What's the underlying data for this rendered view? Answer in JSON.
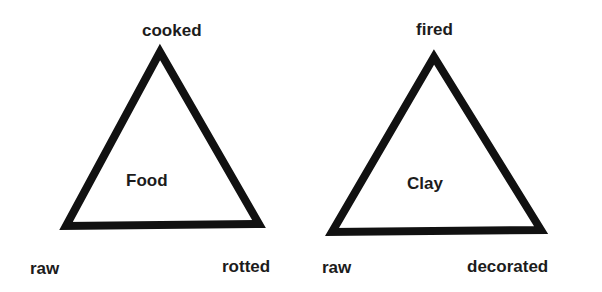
{
  "diagrams": [
    {
      "name": "Food",
      "center_label": "Food",
      "vertices": {
        "top": "cooked",
        "bottom_left": "raw",
        "bottom_right": "rotted"
      }
    },
    {
      "name": "Clay",
      "center_label": "Clay",
      "vertices": {
        "top": "fired",
        "bottom_left": "raw",
        "bottom_right": "decorated"
      }
    }
  ],
  "colors": {
    "stroke": "#111111",
    "background": "#ffffff",
    "text": "#1c1c1c"
  }
}
